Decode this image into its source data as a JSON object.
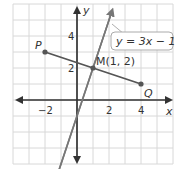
{
  "chart_data": {
    "type": "diagram",
    "grid": {
      "xmin": -4,
      "xmax": 6,
      "ymin": -4,
      "ymax": 6,
      "step": 1
    },
    "x_ticks": [
      {
        "v": -2,
        "label": "−2"
      },
      {
        "v": 2,
        "label": "2"
      },
      {
        "v": 4,
        "label": "4"
      }
    ],
    "y_ticks": [
      {
        "v": 2,
        "label": "2"
      },
      {
        "v": 4,
        "label": "4"
      }
    ],
    "axis_labels": {
      "x": "x",
      "y": "y"
    },
    "segment": {
      "P": [
        -2,
        3
      ],
      "Q": [
        4,
        1
      ]
    },
    "midpoint": {
      "label": "M(1, 2)",
      "coords": [
        1,
        2
      ]
    },
    "line": {
      "equation": "y = 3x − 1",
      "slope": 3,
      "intercept": -1
    },
    "point_labels": {
      "P": "P",
      "Q": "Q"
    }
  }
}
